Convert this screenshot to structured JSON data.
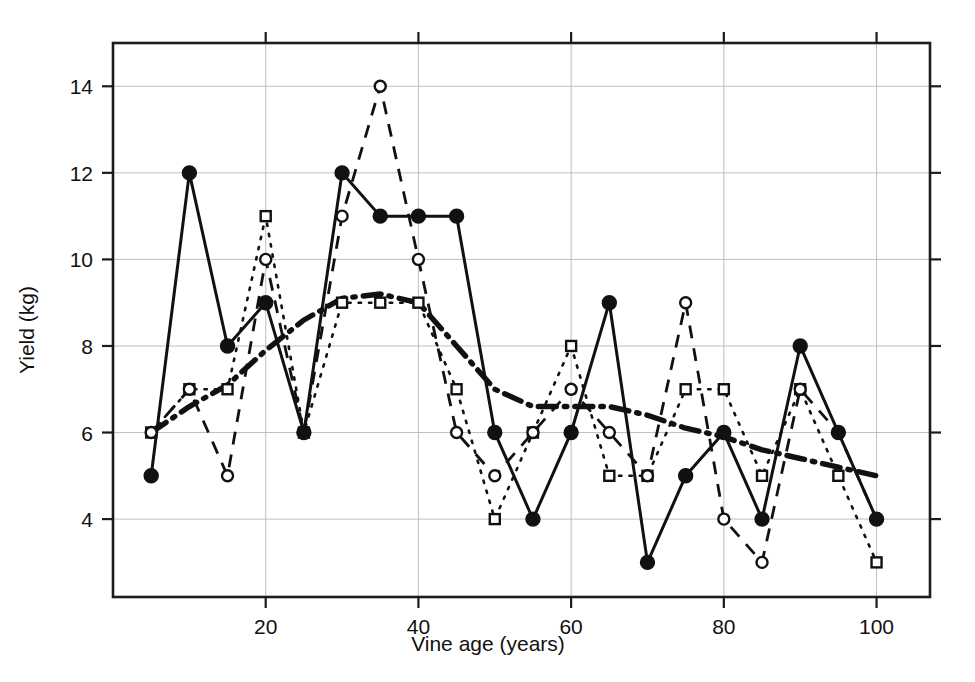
{
  "chart_data": {
    "type": "line",
    "title": "",
    "xlabel": "Vine age (years)",
    "ylabel": "Yield (kg)",
    "xlim": [
      0,
      107
    ],
    "ylim": [
      2.2,
      15.0
    ],
    "grid": true,
    "legend_position": "none",
    "x_ticks": [
      20,
      40,
      60,
      80,
      100
    ],
    "y_ticks": [
      4,
      6,
      8,
      10,
      12,
      14
    ],
    "x_tick_labels": [
      "20",
      "40",
      "60",
      "80",
      "100"
    ],
    "y_tick_labels": [
      "4",
      "6",
      "8",
      "10",
      "12",
      "14"
    ],
    "x": [
      5,
      10,
      15,
      20,
      25,
      30,
      35,
      40,
      45,
      50,
      55,
      60,
      65,
      70,
      75,
      80,
      85,
      90,
      95,
      100
    ],
    "series": [
      {
        "name": "solid-filled-circle",
        "line_style": "solid",
        "marker": "filled-circle",
        "values": [
          5,
          12,
          8,
          9,
          6,
          12,
          11,
          11,
          11,
          6,
          4,
          6,
          9,
          3,
          5,
          6,
          4,
          8,
          6,
          4
        ]
      },
      {
        "name": "dashed-open-circle",
        "line_style": "dashed",
        "marker": "open-circle",
        "values": [
          6,
          7,
          5,
          10,
          6,
          11,
          14,
          10,
          6,
          5,
          6,
          7,
          6,
          5,
          9,
          4,
          3,
          7,
          6,
          4
        ]
      },
      {
        "name": "dotted-open-square",
        "line_style": "dotted",
        "marker": "open-square",
        "values": [
          6,
          7,
          7,
          11,
          6,
          9,
          9,
          9,
          7,
          4,
          6,
          8,
          5,
          5,
          7,
          7,
          5,
          7,
          5,
          3
        ]
      },
      {
        "name": "dash-dot-trend",
        "line_style": "dash-dot",
        "marker": "none",
        "values": [
          6.0,
          6.6,
          7.1,
          7.9,
          8.6,
          9.1,
          9.2,
          9.0,
          8.0,
          7.0,
          6.6,
          6.6,
          6.6,
          6.4,
          6.1,
          5.9,
          5.6,
          5.4,
          5.2,
          5.0
        ]
      }
    ]
  },
  "axes": {
    "y_axis_label": "Yield (kg)",
    "x_axis_label": "Vine age (years)"
  },
  "colors": {
    "ink": "#111111",
    "grid": "#b8b8b8",
    "background": "#ffffff"
  }
}
